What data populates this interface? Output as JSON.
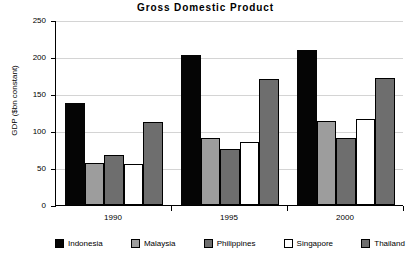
{
  "chart_data": {
    "type": "bar",
    "title": "Gross Domestic Product",
    "xlabel": "",
    "ylabel": "GDP ($bn constant)",
    "categories": [
      "1990",
      "1995",
      "2000"
    ],
    "ylim": [
      0,
      250
    ],
    "yticks": [
      0,
      50,
      100,
      150,
      200,
      250
    ],
    "ytick_labels": [
      "0",
      "50",
      "100",
      "150",
      "200",
      "250"
    ],
    "grid": true,
    "legend_position": "bottom",
    "series": [
      {
        "name": "Indonesia",
        "color": "#050505",
        "values": [
          138,
          203,
          210
        ]
      },
      {
        "name": "Malaysia",
        "color": "#9d9d9d",
        "values": [
          57,
          90,
          114
        ]
      },
      {
        "name": "Philippines",
        "color": "#6e6e6e",
        "values": [
          67,
          76,
          91
        ]
      },
      {
        "name": "Singapore",
        "color": "#ffffff",
        "values": [
          55,
          85,
          116
        ]
      },
      {
        "name": "Thailand",
        "color": "#6e6e6e",
        "values": [
          112,
          170,
          172
        ]
      }
    ]
  }
}
